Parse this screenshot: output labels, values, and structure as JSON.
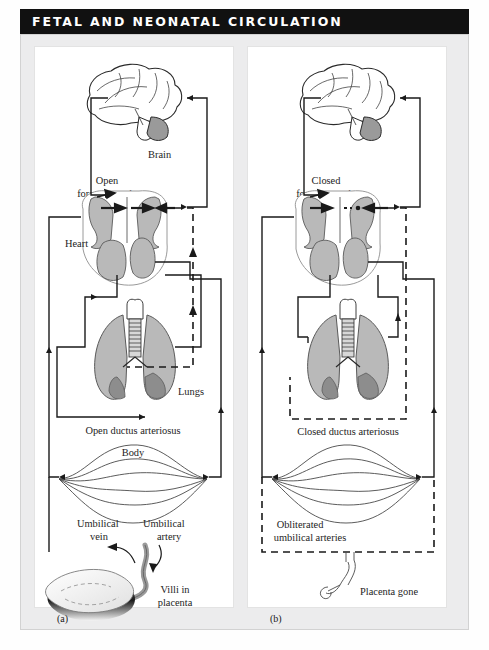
{
  "title": "FETAL AND NEONATAL CIRCULATION",
  "colors": {
    "title_bar_bg": "#111111",
    "title_text": "#ffffff",
    "frame_bg": "#ececed",
    "panel_bg": "#ffffff",
    "line": "#1a1a1a",
    "organ_fill": "#b9b9b9",
    "organ_fill_dark": "#8d8d8d",
    "organ_stroke": "#4a4a4a",
    "label_text": "#1d1d1d"
  },
  "panels": [
    {
      "id": "a",
      "letter": "(a)",
      "caption": "Fetal circulation",
      "labels": {
        "brain": "Brain",
        "foramen_ovale": "Open\nforamen ovale",
        "foramen_ovale_line1": "Open",
        "foramen_ovale_line2": "foramen ovale",
        "heart": "Heart",
        "lungs": "Lungs",
        "ductus": "Open ductus arteriosus",
        "body": "Body",
        "umbilical_vein_line1": "Umbilical",
        "umbilical_vein_line2": "vein",
        "umbilical_artery_line1": "Umbilical",
        "umbilical_artery_line2": "artery",
        "placenta_line1": "Villi in",
        "placenta_line2": "placenta"
      }
    },
    {
      "id": "b",
      "letter": "(b)",
      "caption": "Neonatal circulation",
      "labels": {
        "foramen_ovale_line1": "Closed",
        "foramen_ovale_line2": "foramen ovale",
        "ductus": "Closed ductus arteriosus",
        "obliterated_line1": "Obliterated",
        "obliterated_line2": "umbilical arteries",
        "placenta_gone": "Placenta gone"
      }
    }
  ]
}
